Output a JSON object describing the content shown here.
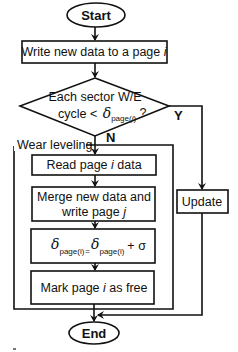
{
  "flowchart": {
    "start_label": "Start",
    "end_label": "End",
    "write_box": {
      "text": "Write new data to a page ",
      "var": "i"
    },
    "decision": {
      "line1": "Each sector W/E",
      "line2_prefix": "cycle < ",
      "symbol": "δ",
      "subscript_pre": "page(",
      "subscript_var": "i",
      "subscript_post": ")",
      "suffix": " ?",
      "yes_label": "Y",
      "no_label": "N"
    },
    "wear_leveling": {
      "title": "Wear leveling",
      "read_box": {
        "pre": "Read page ",
        "var": "i",
        "post": " data"
      },
      "merge_box": {
        "line1": "Merge new data and",
        "line2_pre": "write page ",
        "line2_var": "j"
      },
      "delta_box": {
        "symbol": "δ",
        "subscript": "page(i)",
        "equals": "=",
        "plus_sigma": "+ σ"
      },
      "mark_box": {
        "pre": "Mark page ",
        "var": "i",
        "post": " as free"
      }
    },
    "update_label": "Update",
    "colors": {
      "stroke": "#111111",
      "fill": "#ffffff"
    }
  }
}
